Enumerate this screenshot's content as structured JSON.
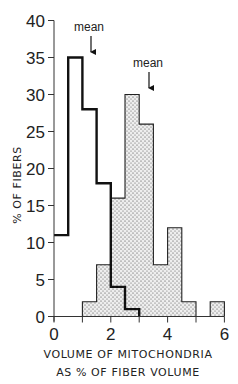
{
  "chart_data": {
    "type": "bar",
    "subtype": "histogram",
    "title": "",
    "xlabel": "VOLUME OF MITOCHONDRIA AS % OF FIBER VOLUME",
    "xlabel_lines": [
      "VOLUME OF MITOCHONDRIA",
      "AS % OF FIBER VOLUME"
    ],
    "ylabel": "% OF FIBERS",
    "xlim": [
      0,
      6
    ],
    "ylim": [
      0,
      40
    ],
    "xticks": [
      0,
      2,
      4,
      6
    ],
    "xticks_minor": [
      1,
      3,
      5
    ],
    "yticks": [
      0,
      5,
      10,
      15,
      20,
      25,
      30,
      35,
      40
    ],
    "grid": false,
    "legend": null,
    "bin_width": 0.5,
    "series": [
      {
        "name": "outlined (bold line)",
        "style": "bold outline, no fill",
        "bins": [
          {
            "x0": 0.0,
            "x1": 0.5,
            "value": 11
          },
          {
            "x0": 0.5,
            "x1": 1.0,
            "value": 35
          },
          {
            "x0": 1.0,
            "x1": 1.5,
            "value": 28
          },
          {
            "x0": 1.5,
            "x1": 2.0,
            "value": 18
          },
          {
            "x0": 2.0,
            "x1": 2.5,
            "value": 4
          },
          {
            "x0": 2.5,
            "x1": 3.0,
            "value": 1
          }
        ],
        "mean": 1.3
      },
      {
        "name": "stippled",
        "style": "dotted fill, thin outline",
        "bins": [
          {
            "x0": 1.0,
            "x1": 1.5,
            "value": 2
          },
          {
            "x0": 1.5,
            "x1": 2.0,
            "value": 7
          },
          {
            "x0": 2.0,
            "x1": 2.5,
            "value": 16
          },
          {
            "x0": 2.5,
            "x1": 3.0,
            "value": 30
          },
          {
            "x0": 3.0,
            "x1": 3.5,
            "value": 26
          },
          {
            "x0": 3.5,
            "x1": 4.0,
            "value": 7
          },
          {
            "x0": 4.0,
            "x1": 4.5,
            "value": 12
          },
          {
            "x0": 4.5,
            "x1": 5.0,
            "value": 2
          },
          {
            "x0": 5.5,
            "x1": 6.0,
            "value": 2
          }
        ],
        "mean": 3.3
      }
    ],
    "annotations": [
      {
        "text": "mean",
        "arrow_x": 1.3,
        "series": "outlined"
      },
      {
        "text": "mean",
        "arrow_x": 3.3,
        "series": "stippled"
      }
    ]
  },
  "labels": {
    "y_ticks": [
      "0",
      "5",
      "10",
      "15",
      "20",
      "25",
      "30",
      "35",
      "40"
    ],
    "x_ticks": [
      "0",
      "2",
      "4",
      "6"
    ],
    "x_title_line1": "VOLUME OF MITOCHONDRIA",
    "x_title_line2": "AS % OF FIBER VOLUME",
    "y_title": "% OF FIBERS",
    "mean_left": "mean",
    "mean_right": "mean"
  }
}
